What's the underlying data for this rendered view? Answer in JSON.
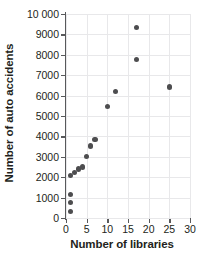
{
  "chart_data": {
    "type": "scatter",
    "title": "",
    "xlabel": "Number of libraries",
    "ylabel": "Number of auto accidents",
    "xlim": [
      0,
      30
    ],
    "ylim": [
      0,
      10000
    ],
    "grid": true,
    "legend": null,
    "marker_color": "#4d4d4f",
    "axis_color": "#58595b",
    "grid_color": "#e8e8ea",
    "xticks": [
      0,
      5,
      10,
      15,
      20,
      25,
      30
    ],
    "xtick_labels": [
      "0",
      "5",
      "10",
      "15",
      "20",
      "25",
      "30"
    ],
    "yticks": [
      0,
      1000,
      2000,
      3000,
      4000,
      5000,
      6000,
      7000,
      8000,
      9000,
      10000
    ],
    "ytick_labels": [
      "0",
      "1000",
      "2000",
      "3000",
      "4000",
      "5000",
      "6000",
      "7000",
      "8000",
      "9000",
      "10 000"
    ],
    "points": [
      {
        "x": 1,
        "y": 300
      },
      {
        "x": 1,
        "y": 750
      },
      {
        "x": 1,
        "y": 1150
      },
      {
        "x": 1,
        "y": 2100
      },
      {
        "x": 2,
        "y": 2250
      },
      {
        "x": 3,
        "y": 2400
      },
      {
        "x": 4,
        "y": 2500
      },
      {
        "x": 5,
        "y": 3000
      },
      {
        "x": 6,
        "y": 3530
      },
      {
        "x": 7,
        "y": 3830
      },
      {
        "x": 10,
        "y": 5480
      },
      {
        "x": 12,
        "y": 6200
      },
      {
        "x": 17,
        "y": 7750
      },
      {
        "x": 17,
        "y": 9350
      },
      {
        "x": 25,
        "y": 6420
      }
    ]
  }
}
